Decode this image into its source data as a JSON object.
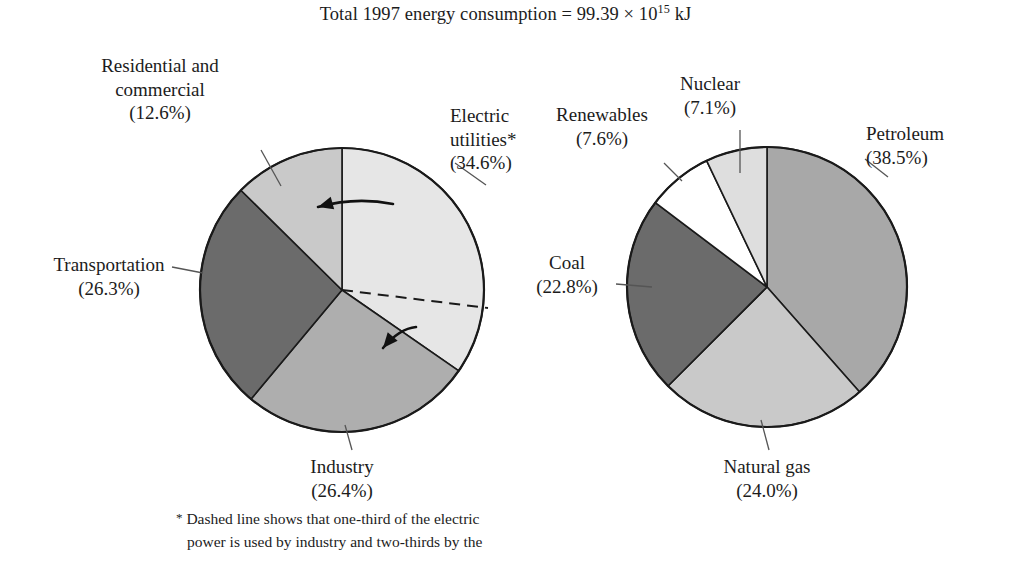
{
  "title": {
    "prefix": "Total 1997 energy consumption = 99.39 × 10",
    "exponent": "15",
    "suffix": " kJ",
    "full": "Total 1997 energy consumption = 99.39 × 10^15 kJ"
  },
  "footnote": {
    "marker": "*",
    "line1": " Dashed line shows that one-third of the electric",
    "line2": "power is used by industry and two-thirds by the"
  },
  "chart_data": [
    {
      "type": "pie",
      "name": "energy-consumption-by-sector",
      "title": "",
      "start_angle_deg": 0,
      "direction": "clockwise",
      "center": [
        342,
        290
      ],
      "radius": 142,
      "categories": [
        "Electric utilities*",
        "Industry",
        "Transportation",
        "Residential and commercial"
      ],
      "values": [
        34.6,
        26.4,
        26.3,
        12.6
      ],
      "colors": [
        "#e6e6e6",
        "#aeaeae",
        "#6b6b6b",
        "#c9c9c9"
      ],
      "slices": [
        {
          "label_line1": "Electric",
          "label_line2": "utilities*",
          "label_line3": "(34.6%)",
          "value": 34.6,
          "color": "#e6e6e6",
          "label_pos": [
            450,
            104
          ],
          "label_align": "left",
          "leader": [
            [
              486,
              185
            ],
            [
              455,
              163
            ]
          ]
        },
        {
          "label_line1": "Industry",
          "label_line2": "(26.4%)",
          "value": 26.4,
          "color": "#aeaeae",
          "label_pos": [
            298,
            455
          ],
          "label_align": "center",
          "leader": [
            [
              345,
              425
            ],
            [
              352,
              450
            ]
          ]
        },
        {
          "label_line1": "Transportation",
          "label_line2": "(26.3%)",
          "value": 26.3,
          "color": "#6b6b6b",
          "label_pos": [
            34,
            253
          ],
          "label_align": "left",
          "leader": [
            [
              203,
              273
            ],
            [
              172,
              267
            ]
          ]
        },
        {
          "label_line1": "Residential and",
          "label_line2": "commercial",
          "label_line3": "(12.6%)",
          "value": 12.6,
          "color": "#c9c9c9",
          "label_pos": [
            160,
            54
          ],
          "label_align": "center",
          "leader": [
            [
              281,
              186
            ],
            [
              261,
              150
            ]
          ]
        }
      ],
      "annotations": {
        "dashed_line": {
          "from": [
            342,
            290
          ],
          "to": [
            488,
            308
          ]
        },
        "arrows": [
          {
            "from": [
              393,
              204
            ],
            "to": [
              318,
              207
            ]
          },
          {
            "from": [
              416,
              327
            ],
            "to": [
              383,
              348
            ]
          }
        ]
      }
    },
    {
      "type": "pie",
      "name": "energy-consumption-by-source",
      "title": "",
      "start_angle_deg": 0,
      "direction": "clockwise",
      "center": [
        767,
        287
      ],
      "radius": 140,
      "categories": [
        "Petroleum",
        "Natural gas",
        "Coal",
        "Renewables",
        "Nuclear"
      ],
      "values": [
        38.5,
        24.0,
        22.8,
        7.6,
        7.1
      ],
      "colors": [
        "#a8a8a8",
        "#c9c9c9",
        "#6b6b6b",
        "#ffffff",
        "#dedede"
      ],
      "slices": [
        {
          "label_line1": "Petroleum",
          "label_line2": "(38.5%)",
          "value": 38.5,
          "color": "#a8a8a8",
          "label_pos": [
            873,
            122
          ],
          "label_align": "left",
          "leader": [
            [
              865,
              159
            ],
            [
              888,
              177
            ]
          ]
        },
        {
          "label_line1": "Natural gas",
          "label_line2": "(24.0%)",
          "value": 24.0,
          "color": "#c9c9c9",
          "label_pos": [
            706,
            455
          ],
          "label_align": "center",
          "leader": [
            [
              761,
              420
            ],
            [
              769,
              450
            ]
          ]
        },
        {
          "label_line1": "Coal",
          "label_line2": "(22.8%)",
          "value": 22.8,
          "color": "#6b6b6b",
          "label_pos": [
            536,
            251
          ],
          "label_align": "center",
          "leader": [
            [
              652,
              287
            ],
            [
              616,
              284
            ]
          ]
        },
        {
          "label_line1": "Renewables",
          "label_line2": "(7.6%)",
          "value": 7.6,
          "color": "#ffffff",
          "label_pos": [
            582,
            103
          ],
          "label_align": "center",
          "leader": [
            [
              682,
              181
            ],
            [
              664,
              163
            ]
          ]
        },
        {
          "label_line1": "Nuclear",
          "label_line2": "(7.1%)",
          "value": 7.1,
          "color": "#dedede",
          "label_pos": [
            710,
            72
          ],
          "label_align": "center",
          "leader": [
            [
              740,
              173
            ],
            [
              740,
              130
            ]
          ]
        }
      ]
    }
  ]
}
